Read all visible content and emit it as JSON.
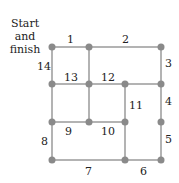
{
  "diagram": {
    "start_label_line1": "Start",
    "start_label_line2": "and",
    "start_label_line3": "finish",
    "edge_color": "#9a9a9a",
    "node_color": "#8a8a8a",
    "nodes": [
      {
        "id": "A",
        "x": 52,
        "y": 47
      },
      {
        "id": "B",
        "x": 89,
        "y": 47
      },
      {
        "id": "C",
        "x": 161,
        "y": 47
      },
      {
        "id": "D",
        "x": 52,
        "y": 84
      },
      {
        "id": "E",
        "x": 89,
        "y": 84
      },
      {
        "id": "F",
        "x": 125,
        "y": 84
      },
      {
        "id": "G",
        "x": 161,
        "y": 84
      },
      {
        "id": "H",
        "x": 52,
        "y": 122
      },
      {
        "id": "I",
        "x": 89,
        "y": 122
      },
      {
        "id": "J",
        "x": 125,
        "y": 122
      },
      {
        "id": "K",
        "x": 161,
        "y": 122
      },
      {
        "id": "L",
        "x": 52,
        "y": 160
      },
      {
        "id": "M",
        "x": 125,
        "y": 160
      },
      {
        "id": "N",
        "x": 161,
        "y": 160
      }
    ],
    "edges": [
      {
        "label": "1",
        "from": "A",
        "to": "B"
      },
      {
        "label": "2",
        "from": "B",
        "to": "C"
      },
      {
        "label": "3",
        "from": "C",
        "to": "G"
      },
      {
        "label": "4",
        "from": "G",
        "to": "K"
      },
      {
        "label": "5",
        "from": "K",
        "to": "N"
      },
      {
        "label": "6",
        "from": "N",
        "to": "M"
      },
      {
        "label": "7",
        "from": "M",
        "to": "L"
      },
      {
        "label": "8",
        "from": "L",
        "to": "H"
      },
      {
        "label": "9",
        "from": "H",
        "to": "I"
      },
      {
        "label": "10",
        "from": "I",
        "to": "J"
      },
      {
        "label": "11",
        "from": "J",
        "to": "F"
      },
      {
        "label": "12",
        "from": "F",
        "to": "E"
      },
      {
        "label": "13",
        "from": "E",
        "to": "D"
      },
      {
        "label": "14",
        "from": "D",
        "to": "A"
      }
    ],
    "extra_edges": [
      {
        "from": "B",
        "to": "E"
      },
      {
        "from": "E",
        "to": "I"
      },
      {
        "from": "F",
        "to": "G"
      },
      {
        "from": "D",
        "to": "H"
      },
      {
        "from": "J",
        "to": "M"
      }
    ],
    "edge_labels": {
      "e1": "1",
      "e2": "2",
      "e3": "3",
      "e4": "4",
      "e5": "5",
      "e6": "6",
      "e7": "7",
      "e8": "8",
      "e9": "9",
      "e10": "10",
      "e11": "11",
      "e12": "12",
      "e13": "13",
      "e14": "14"
    }
  }
}
